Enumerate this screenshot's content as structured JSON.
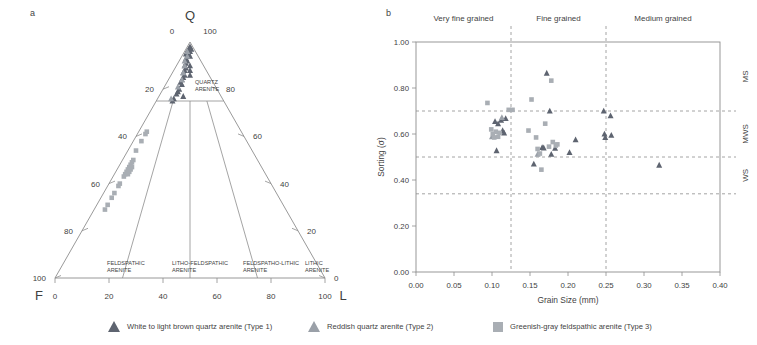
{
  "figure": {
    "panel_a_label": "a",
    "panel_b_label": "b"
  },
  "ternary": {
    "apex_top_label": "Q",
    "apex_left_label": "F",
    "apex_right_label": "L",
    "top_left_tick": "0",
    "top_right_tick": "100",
    "left_axis_ticks": [
      "20",
      "40",
      "60",
      "80",
      "100"
    ],
    "right_axis_ticks": [
      "80",
      "60",
      "40",
      "20",
      "0"
    ],
    "bottom_axis_ticks": [
      "0",
      "20",
      "40",
      "60",
      "80",
      "100"
    ],
    "fields": [
      {
        "line1": "QUARTZ",
        "line2": "ARENITE"
      },
      {
        "line1": "FELDSPATHIC",
        "line2": "ARENITE"
      },
      {
        "line1": "LITHO-FELDSPATHIC",
        "line2": "ARENITE"
      },
      {
        "line1": "FELDSPATHO-LITHIC",
        "line2": "ARENITE"
      },
      {
        "line1": "LITHIC",
        "line2": "ARENITE"
      }
    ]
  },
  "chart_data": [
    {
      "type": "scatter",
      "name": "QFL ternary diagram",
      "title": "",
      "axes": {
        "top": "Q",
        "left": "F",
        "right": "L"
      },
      "series": [
        {
          "name": "White to light brown quartz arenite (Type 1)",
          "marker": "triangle-dark",
          "color": "#5e6470",
          "points_qfl": [
            [
              97,
              2,
              1
            ],
            [
              96,
              3,
              1
            ],
            [
              95,
              3,
              2
            ],
            [
              98,
              1,
              1
            ],
            [
              97,
              1,
              2
            ],
            [
              95,
              4,
              1
            ],
            [
              94,
              4,
              2
            ],
            [
              96,
              2,
              2
            ],
            [
              93,
              5,
              2
            ],
            [
              92,
              5,
              3
            ],
            [
              94,
              3,
              3
            ],
            [
              91,
              6,
              3
            ],
            [
              90,
              7,
              3
            ],
            [
              89,
              7,
              4
            ],
            [
              88,
              8,
              4
            ],
            [
              90,
              5,
              5
            ],
            [
              87,
              9,
              4
            ],
            [
              86,
              9,
              5
            ],
            [
              85,
              10,
              5
            ],
            [
              88,
              6,
              6
            ],
            [
              84,
              11,
              5
            ],
            [
              86,
              7,
              7
            ],
            [
              83,
              12,
              5
            ],
            [
              82,
              12,
              6
            ],
            [
              80,
              14,
              6
            ],
            [
              79,
              15,
              6
            ],
            [
              78,
              16,
              6
            ],
            [
              76,
              18,
              6
            ],
            [
              75,
              19,
              6
            ],
            [
              77,
              14,
              9
            ]
          ]
        },
        {
          "name": "Reddish quartz arenite (Type 2)",
          "marker": "triangle-light",
          "color": "#9aa0a8",
          "points_qfl": [
            [
              96,
              3,
              1
            ],
            [
              94,
              4,
              2
            ],
            [
              92,
              6,
              2
            ],
            [
              90,
              7,
              3
            ],
            [
              87,
              9,
              4
            ],
            [
              84,
              11,
              5
            ],
            [
              81,
              14,
              5
            ],
            [
              76,
              19,
              5
            ]
          ]
        },
        {
          "name": "Greenish-gray feldspathic arenite (Type 3)",
          "marker": "square",
          "color": "#a9aeb4",
          "points_qfl": [
            [
              62,
              35,
              3
            ],
            [
              61,
              36,
              3
            ],
            [
              58,
              39,
              3
            ],
            [
              54,
              43,
              3
            ],
            [
              50,
              46,
              4
            ],
            [
              49,
              47,
              4
            ],
            [
              48,
              48,
              4
            ],
            [
              47,
              49,
              4
            ],
            [
              46,
              50,
              4
            ],
            [
              47,
              48,
              5
            ],
            [
              46,
              49,
              5
            ],
            [
              45,
              51,
              4
            ],
            [
              44,
              52,
              4
            ],
            [
              45,
              50,
              5
            ],
            [
              44,
              51,
              5
            ],
            [
              43,
              53,
              4
            ],
            [
              40,
              56,
              4
            ],
            [
              39,
              57,
              4
            ],
            [
              36,
              60,
              4
            ],
            [
              34,
              62,
              4
            ],
            [
              31,
              65,
              4
            ],
            [
              29,
              67,
              4
            ]
          ]
        }
      ]
    },
    {
      "type": "scatter",
      "name": "Grain size versus sorting",
      "title": "",
      "xlabel": "Grain Size (mm)",
      "ylabel": "Sorting (σ)",
      "xlim": [
        0.0,
        0.4
      ],
      "ylim": [
        0.0,
        1.0
      ],
      "xticks": [
        "0.00",
        "0.05",
        "0.10",
        "0.15",
        "0.20",
        "0.25",
        "0.30",
        "0.35",
        "0.40"
      ],
      "yticks": [
        "0.00",
        "0.20",
        "0.40",
        "0.60",
        "0.80",
        "1.00"
      ],
      "grid": false,
      "legend_position": "below-figure",
      "top_category_labels": [
        "Very fine grained",
        "Fine grained",
        "Medium grained"
      ],
      "vertical_dividers": [
        0.125,
        0.25
      ],
      "right_category_labels": [
        "MS",
        "MWS",
        "WS"
      ],
      "horizontal_dividers": [
        0.7,
        0.5,
        0.34
      ],
      "series": [
        {
          "name": "White to light brown quartz arenite (Type 1)",
          "marker": "triangle-dark",
          "color": "#5e6470",
          "x": [
            0.104,
            0.108,
            0.112,
            0.114,
            0.116,
            0.118,
            0.106,
            0.155,
            0.166,
            0.168,
            0.172,
            0.176,
            0.178,
            0.183,
            0.202,
            0.21,
            0.247,
            0.248,
            0.249,
            0.256,
            0.257,
            0.32
          ],
          "y": [
            0.655,
            0.645,
            0.66,
            0.615,
            0.605,
            0.668,
            0.528,
            0.47,
            0.542,
            0.54,
            0.865,
            0.7,
            0.512,
            0.538,
            0.52,
            0.575,
            0.7,
            0.6,
            0.585,
            0.68,
            0.595,
            0.465
          ]
        },
        {
          "name": "Reddish quartz arenite (Type 2)",
          "marker": "triangle-light",
          "color": "#9aa0a8",
          "x": [
            0.1,
            0.113,
            0.16
          ],
          "y": [
            0.588,
            0.672,
            0.512
          ]
        },
        {
          "name": "Greenish-gray feldspathic arenite (Type 3)",
          "marker": "square",
          "color": "#a9aeb4",
          "x": [
            0.094,
            0.099,
            0.101,
            0.103,
            0.105,
            0.108,
            0.11,
            0.122,
            0.127,
            0.148,
            0.152,
            0.158,
            0.16,
            0.163,
            0.165,
            0.17,
            0.175,
            0.178,
            0.18,
            0.184,
            0.186
          ],
          "y": [
            0.735,
            0.62,
            0.6,
            0.585,
            0.61,
            0.588,
            0.605,
            0.705,
            0.705,
            0.615,
            0.75,
            0.585,
            0.535,
            0.515,
            0.445,
            0.645,
            0.545,
            0.832,
            0.565,
            0.55,
            0.555
          ]
        }
      ]
    }
  ],
  "legend": {
    "items": [
      {
        "label": "White to light brown quartz arenite (Type 1)",
        "marker": "triangle-dark"
      },
      {
        "label": "Reddish quartz arenite (Type 2)",
        "marker": "triangle-light"
      },
      {
        "label": "Greenish-gray feldspathic arenite (Type 3)",
        "marker": "square"
      }
    ]
  }
}
